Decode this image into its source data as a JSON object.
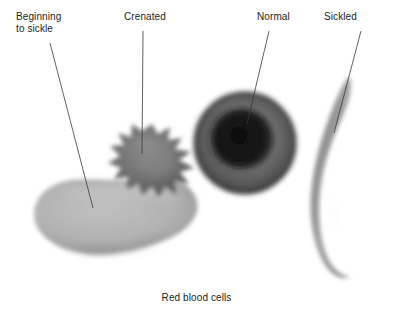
{
  "figure": {
    "caption": "Red blood cells",
    "background_color": "#ffffff",
    "text_color": "#1c1c1c"
  },
  "labels": {
    "beginning_to_sickle": "Beginning\nto sickle",
    "crenated": "Crenated",
    "normal": "Normal",
    "sickled": "Sickled"
  },
  "cells": [
    {
      "id": "beginning-to-sickle-cell",
      "label": "Beginning to sickle",
      "shape": "irregular elongated blob with blunt lobes",
      "fill_color": "#b2b2b2",
      "shadow_color": "#8f8f8f"
    },
    {
      "id": "crenated-cell",
      "label": "Crenated",
      "shape": "spiky star-shaped cell with spicules",
      "fill_color": "#6e6e6e",
      "shadow_color": "#555555"
    },
    {
      "id": "normal-cell",
      "label": "Normal",
      "shape": "biconcave round disc with central pallor",
      "fill_color": "#4a4a4a",
      "center_color": "#141414"
    },
    {
      "id": "sickled-cell",
      "label": "Sickled",
      "shape": "elongated crescent with pointed ends",
      "fill_color": "#9a9a9a",
      "shadow_color": "#5a5a5a"
    }
  ],
  "leader_lines": [
    {
      "id": "leader-beginning-to-sickle",
      "from": "label Beginning to sickle",
      "to": "beginning-to-sickle-cell"
    },
    {
      "id": "leader-crenated",
      "from": "label Crenated",
      "to": "crenated-cell"
    },
    {
      "id": "leader-normal",
      "from": "label Normal",
      "to": "normal-cell"
    },
    {
      "id": "leader-sickled",
      "from": "label Sickled",
      "to": "sickled-cell"
    }
  ]
}
